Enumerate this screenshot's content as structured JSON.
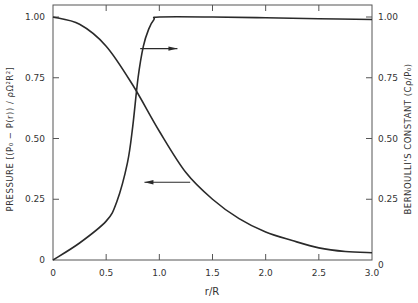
{
  "chart_data": {
    "type": "line",
    "title": "",
    "xlabel": "r/R",
    "ylabel": "PRESSURE  [(P₀ − P(r)) / ρΩ²R²]",
    "ylabel_right": "BERNOULLI'S CONSTANT  (Cρ/P₀)",
    "xlim": [
      0,
      3.0
    ],
    "ylim": [
      0,
      1.0
    ],
    "ylim_right": [
      0,
      1.0
    ],
    "x_ticks": [
      "0",
      "0.5",
      "1.0",
      "1.5",
      "2.0",
      "2.5",
      "3.0"
    ],
    "x_tick_values": [
      0,
      0.5,
      1.0,
      1.5,
      2.0,
      2.5,
      3.0
    ],
    "y_ticks": [
      "0",
      "0.25",
      "0.50",
      "0.75",
      "1.00"
    ],
    "y_tick_values": [
      0,
      0.25,
      0.5,
      0.75,
      1.0
    ],
    "y_ticks_right": [
      "0",
      "0.25",
      "0.50",
      "0.75",
      "1.00"
    ],
    "grid": false,
    "legend": "none (arrows indicate axis for each curve)",
    "series": [
      {
        "name": "Pressure",
        "axis": "left",
        "x": [
          0,
          0.25,
          0.5,
          0.75,
          1.0,
          1.25,
          1.5,
          1.75,
          2.0,
          2.25,
          2.5,
          2.75,
          3.0
        ],
        "values": [
          1.0,
          0.97,
          0.88,
          0.72,
          0.53,
          0.36,
          0.25,
          0.17,
          0.115,
          0.08,
          0.05,
          0.035,
          0.03
        ]
      },
      {
        "name": "Bernoulli's constant",
        "axis": "right",
        "x": [
          0,
          0.25,
          0.5,
          0.6,
          0.7,
          0.75,
          0.8,
          0.85,
          0.9,
          0.95,
          1.0,
          1.5,
          2.0,
          2.5,
          3.0
        ],
        "values": [
          0,
          0.07,
          0.16,
          0.24,
          0.4,
          0.55,
          0.75,
          0.88,
          0.95,
          0.99,
          1.0,
          1.0,
          0.997,
          0.993,
          0.99
        ]
      }
    ],
    "annotations": [
      {
        "type": "arrow",
        "direction": "right",
        "points_to": "right axis",
        "from_series": "Bernoulli's constant",
        "x_from": 0.82,
        "x_to": 1.17,
        "y": 0.87
      },
      {
        "type": "arrow",
        "direction": "left",
        "points_to": "left axis",
        "from_series": "Pressure",
        "x_from": 1.29,
        "x_to": 0.86,
        "y": 0.32
      }
    ]
  }
}
